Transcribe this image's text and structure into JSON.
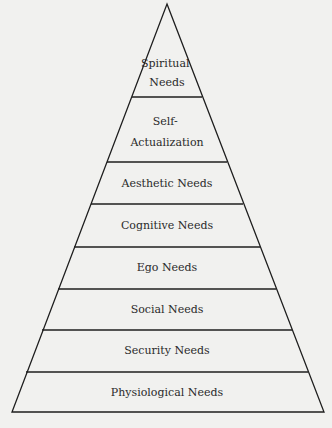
{
  "diagram": {
    "type": "pyramid",
    "colors": {
      "background": "#f1f1ef",
      "stroke": "#1e1e1e",
      "text": "#2a2a2a"
    },
    "levels_top_to_bottom": [
      {
        "lines": [
          "Spiritual",
          "Needs"
        ]
      },
      {
        "lines": [
          "Self-",
          "Actualization"
        ]
      },
      {
        "lines": [
          "Aesthetic Needs"
        ]
      },
      {
        "lines": [
          "Cognitive Needs"
        ]
      },
      {
        "lines": [
          "Ego Needs"
        ]
      },
      {
        "lines": [
          "Social Needs"
        ]
      },
      {
        "lines": [
          "Security Needs"
        ]
      },
      {
        "lines": [
          "Physiological Needs"
        ]
      }
    ]
  }
}
